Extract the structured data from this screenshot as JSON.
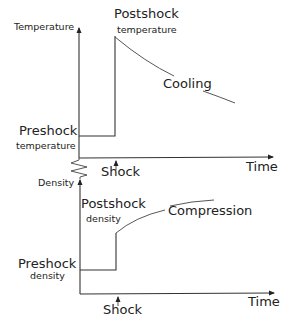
{
  "diagram": {
    "title": "",
    "top_panel": {
      "y_axis_label": "Temperature",
      "x_axis_label": "Time",
      "preshock_label_line1": "Preshock",
      "preshock_label_line2": "temperature",
      "postshock_label_line1": "Postshock",
      "postshock_label_line2": "temperature",
      "curve_label": "Cooling",
      "event_label": "Shock"
    },
    "bottom_panel": {
      "y_axis_label": "Density",
      "x_axis_label": "Time",
      "preshock_label_line1": "Preshock",
      "preshock_label_line2": "density",
      "postshock_label_line1": "Postshock",
      "postshock_label_line2": "density",
      "curve_label": "Compression",
      "event_label": "Shock"
    },
    "colors": {
      "line": "#333333",
      "text": "#222222",
      "background": "#ffffff"
    }
  }
}
